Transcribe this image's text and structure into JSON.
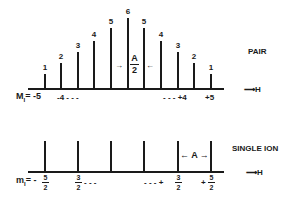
{
  "pair": {
    "label": "PAIR",
    "axis_label": "H",
    "lines": [
      {
        "x": 45,
        "intensity": "1",
        "height": 14
      },
      {
        "x": 61,
        "intensity": "2",
        "height": 25
      },
      {
        "x": 78,
        "intensity": "3",
        "height": 36
      },
      {
        "x": 94,
        "intensity": "4",
        "height": 47
      },
      {
        "x": 111,
        "intensity": "5",
        "height": 60
      },
      {
        "x": 128,
        "intensity": "6",
        "height": 70
      },
      {
        "x": 144,
        "intensity": "5",
        "height": 60
      },
      {
        "x": 161,
        "intensity": "4",
        "height": 47
      },
      {
        "x": 178,
        "intensity": "3",
        "height": 36
      },
      {
        "x": 194,
        "intensity": "2",
        "height": 25
      },
      {
        "x": 211,
        "intensity": "1",
        "height": 14
      }
    ],
    "spacing_label_num": "A",
    "spacing_label_den": "2",
    "m_label": "M",
    "m_sub": "I",
    "m_left": "= -5",
    "m_left2": "-4 - - -",
    "m_right": "- - - +4",
    "m_right2": "+5"
  },
  "single_ion": {
    "label": "SINGLE ION",
    "axis_label": "H",
    "lines": [
      45,
      78,
      111,
      144,
      178,
      211
    ],
    "spacing_label": "A",
    "m_label": "m",
    "m_sub": "I",
    "m_eq": "= -",
    "m_first": {
      "num": "5",
      "den": "2"
    },
    "m_second": {
      "num": "3",
      "den": "2"
    },
    "m_second_suffix": "- - -",
    "m_third_prefix": "- - - +",
    "m_third": {
      "num": "3",
      "den": "2"
    },
    "m_fourth_prefix": "+",
    "m_fourth": {
      "num": "5",
      "den": "2"
    }
  }
}
